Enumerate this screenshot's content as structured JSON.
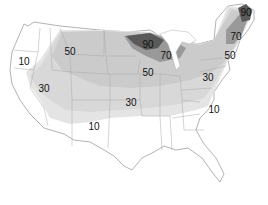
{
  "map": {
    "subject": "United States contour map",
    "zones": [
      {
        "value": "10",
        "shade": "#e6e6e6"
      },
      {
        "value": "30",
        "shade": "#d9d9d9"
      },
      {
        "value": "50",
        "shade": "#cccccc"
      },
      {
        "value": "70",
        "shade": "#9a9a9a"
      },
      {
        "value": "90",
        "shade": "#5c5c5c"
      }
    ],
    "labels": [
      {
        "text": "90",
        "x": 246,
        "y": 13
      },
      {
        "text": "90",
        "x": 148,
        "y": 45
      },
      {
        "text": "70",
        "x": 236,
        "y": 37
      },
      {
        "text": "70",
        "x": 166,
        "y": 56
      },
      {
        "text": "50",
        "x": 70,
        "y": 52
      },
      {
        "text": "50",
        "x": 230,
        "y": 56
      },
      {
        "text": "50",
        "x": 148,
        "y": 73
      },
      {
        "text": "30",
        "x": 208,
        "y": 78
      },
      {
        "text": "10",
        "x": 24,
        "y": 62
      },
      {
        "text": "30",
        "x": 44,
        "y": 89
      },
      {
        "text": "30",
        "x": 131,
        "y": 103
      },
      {
        "text": "10",
        "x": 214,
        "y": 110
      },
      {
        "text": "10",
        "x": 94,
        "y": 127
      }
    ]
  }
}
